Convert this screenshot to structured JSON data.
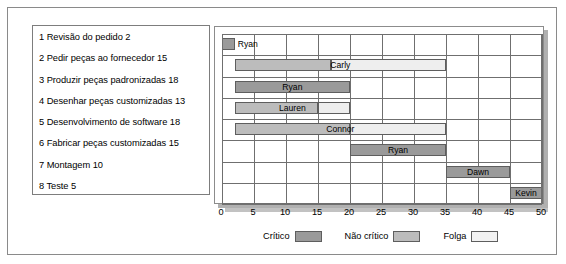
{
  "chart_data": {
    "type": "bar",
    "subtype": "gantt",
    "title": "",
    "xlabel": "",
    "ylabel": "",
    "xlim": [
      0,
      50
    ],
    "xticks": [
      0,
      5,
      10,
      15,
      20,
      25,
      30,
      35,
      40,
      45,
      50
    ],
    "grid": true,
    "legend_position": "bottom",
    "legend": [
      {
        "key": "critical",
        "label": "Crítico",
        "color": "#9a9a9a"
      },
      {
        "key": "noncritical",
        "label": "Não crítico",
        "color": "#bcbcbc"
      },
      {
        "key": "slack",
        "label": "Folga",
        "color": "#f2f2f2"
      }
    ],
    "categories": [
      "1 Revisão do pedido 2",
      "2 Pedir peças ao fornecedor 15",
      "3 Produzir peças padronizadas 18",
      "4 Desenhar peças customizadas 13",
      "5 Desenvolvimento de software 18",
      "6 Fabricar peças customizadas 15",
      "7 Montagem 10",
      "8 Teste 5"
    ],
    "tasks": [
      {
        "id": 1,
        "name": "Revisão do pedido",
        "duration": 2,
        "label": "1 Revisão do pedido 2",
        "start": 0,
        "end": 2,
        "type": "critical",
        "slack_start": 0,
        "slack_end": 0,
        "resource": "Ryan",
        "label_inside": false
      },
      {
        "id": 2,
        "name": "Pedir peças ao fornecedor",
        "duration": 15,
        "label": "2 Pedir peças ao fornecedor 15",
        "start": 2,
        "end": 17,
        "type": "noncritical",
        "slack_start": 17,
        "slack_end": 35,
        "resource": "Carly",
        "label_inside": true
      },
      {
        "id": 3,
        "name": "Produzir peças padronizadas",
        "duration": 18,
        "label": "3 Produzir peças padronizadas 18",
        "start": 2,
        "end": 20,
        "type": "critical",
        "slack_start": 0,
        "slack_end": 0,
        "resource": "Ryan",
        "label_inside": true
      },
      {
        "id": 4,
        "name": "Desenhar peças customizadas",
        "duration": 13,
        "label": "4 Desenhar peças customizadas 13",
        "start": 2,
        "end": 15,
        "type": "noncritical",
        "slack_start": 15,
        "slack_end": 20,
        "resource": "Lauren",
        "label_inside": true
      },
      {
        "id": 5,
        "name": "Desenvolvimento de software",
        "duration": 18,
        "label": "5 Desenvolvimento de software 18",
        "start": 2,
        "end": 20,
        "type": "noncritical",
        "slack_start": 20,
        "slack_end": 35,
        "resource": "Connor",
        "label_inside": true
      },
      {
        "id": 6,
        "name": "Fabricar peças customizadas",
        "duration": 15,
        "label": "6 Fabricar peças customizadas 15",
        "start": 20,
        "end": 35,
        "type": "critical",
        "slack_start": 0,
        "slack_end": 0,
        "resource": "Ryan",
        "label_inside": true
      },
      {
        "id": 7,
        "name": "Montagem",
        "duration": 10,
        "label": "7 Montagem 10",
        "start": 35,
        "end": 45,
        "type": "critical",
        "slack_start": 0,
        "slack_end": 0,
        "resource": "Dawn",
        "label_inside": true
      },
      {
        "id": 8,
        "name": "Teste",
        "duration": 5,
        "label": "8 Teste 5",
        "start": 45,
        "end": 50,
        "type": "critical",
        "slack_start": 0,
        "slack_end": 0,
        "resource": "Kevin",
        "label_inside": true
      }
    ]
  }
}
